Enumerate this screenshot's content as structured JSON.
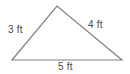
{
  "figure": {
    "name": "right-triangle-side-lengths",
    "background_color": "#ffffff",
    "stroke_color": "#808080",
    "text_color": "#4a4a4a",
    "stroke_width": 1.2,
    "width": 130,
    "height": 74
  },
  "shape": {
    "type": "triangle",
    "vertices": [
      {
        "name": "left-vertex",
        "x": 12,
        "y": 60
      },
      {
        "name": "apex-vertex",
        "x": 57,
        "y": 6
      },
      {
        "name": "right-vertex",
        "x": 122,
        "y": 60
      }
    ],
    "path": "M 12 60 L 57 6 L 122 60 Z"
  },
  "labels": {
    "left_side": "3 ft",
    "right_side": "4 ft",
    "base_side": "5 ft"
  },
  "measurements": {
    "side_a_length": 3,
    "side_b_length": 4,
    "side_c_length": 5,
    "unit": "ft"
  }
}
